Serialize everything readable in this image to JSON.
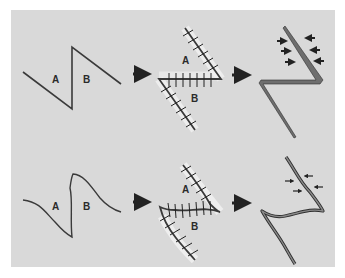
{
  "figure": {
    "colors": {
      "panel_background": "#d9d9d9",
      "line": "#3a3a3a",
      "scar_fill": "#6e6e6e",
      "scar_edge": "#2e2e2e",
      "suture_halo": "#f2f2f2"
    },
    "rows": [
      {
        "name": "straight-z-plasty",
        "step1": {
          "labels": [
            "A",
            "B"
          ]
        },
        "step2": {
          "labels": [
            "A",
            "B"
          ]
        },
        "transition_arrows": [
          "solid-arrow",
          "dotted-arrow"
        ]
      },
      {
        "name": "curved-z-plasty",
        "step1": {
          "labels": [
            "A",
            "B"
          ]
        },
        "step2": {
          "labels": [
            "A",
            "B"
          ]
        },
        "transition_arrows": [
          "solid-arrow",
          "dotted-arrow"
        ]
      }
    ],
    "labels": {
      "r1s1_a": "A",
      "r1s1_b": "B",
      "r1s2_a": "A",
      "r1s2_b": "B",
      "r2s1_a": "A",
      "r2s1_b": "B",
      "r2s2_a": "A",
      "r2s2_b": "B"
    }
  }
}
